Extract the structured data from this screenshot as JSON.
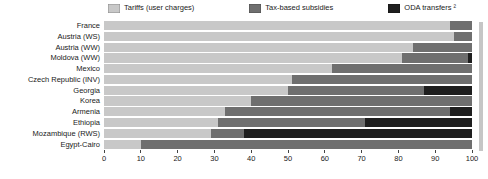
{
  "chart_data": {
    "type": "bar",
    "orientation": "horizontal",
    "stacked": true,
    "title": "",
    "xlabel": "",
    "ylabel": "",
    "xlim": [
      0,
      100
    ],
    "xticks": [
      0,
      10,
      20,
      30,
      40,
      50,
      60,
      70,
      80,
      90,
      100
    ],
    "grid": false,
    "legend_position": "top",
    "categories": [
      "France",
      "Austria (WS)",
      "Austria (WW)",
      "Moldova (WW)",
      "Mexico",
      "Czech Republic (INV)",
      "Georgia",
      "Korea",
      "Armenia",
      "Ethiopia",
      "Mozambique (RWS)",
      "Egypt-Cairo"
    ],
    "series": [
      {
        "name": "Tariffs (user charges)",
        "color": "#c8c8c8",
        "values": [
          94,
          95,
          84,
          81,
          62,
          51,
          50,
          40,
          33,
          31,
          29,
          10
        ]
      },
      {
        "name": "Tax-based subsidies",
        "color": "#6f6f6f",
        "values": [
          6,
          5,
          16,
          18,
          38,
          49,
          37,
          60,
          61,
          40,
          9,
          90
        ]
      },
      {
        "name": "ODA transfers ²",
        "color": "#1f1f1f",
        "values": [
          0,
          0,
          0,
          1,
          0,
          0,
          13,
          0,
          6,
          29,
          62,
          0
        ]
      }
    ]
  },
  "colors": {
    "tariffs": "#c8c8c8",
    "tax_subsidies": "#6f6f6f",
    "oda_transfers": "#1f1f1f",
    "axis_text": "#1a1a1a"
  }
}
